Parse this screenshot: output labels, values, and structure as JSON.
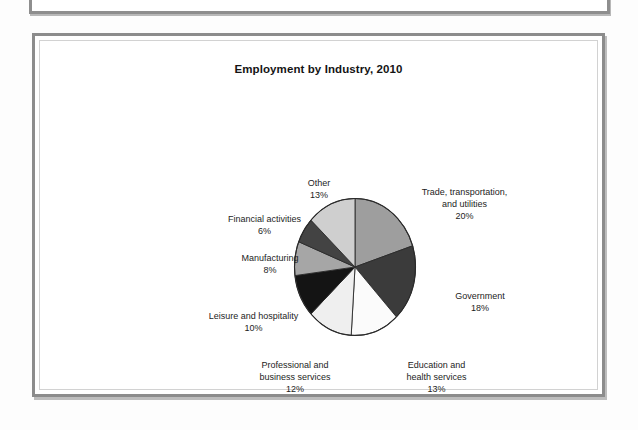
{
  "figure": {
    "title": "Employment by Industry, 2010"
  },
  "chart_data": {
    "type": "pie",
    "title": "Employment by Industry, 2010",
    "xlabel": "",
    "ylabel": "",
    "legend_position": "none",
    "labels_outside": true,
    "unit": "percent",
    "categories": [
      "Trade, transportation, and utilities",
      "Government",
      "Education and health services",
      "Professional and business services",
      "Leisure and hospitality",
      "Manufacturing",
      "Financial activities",
      "Other"
    ],
    "values": [
      20,
      18,
      13,
      12,
      10,
      8,
      6,
      13
    ],
    "colors": [
      "#9e9e9e",
      "#3b3b3b",
      "#fbfbfb",
      "#efefef",
      "#141414",
      "#a6a6a6",
      "#434343",
      "#cfcfcf"
    ],
    "slices": [
      {
        "name": "trade-transportation-utilities",
        "label_lines": [
          "Trade, transportation,",
          "and utilities",
          "20%"
        ],
        "value": 20,
        "percent_label": "20%",
        "color": "#9e9e9e"
      },
      {
        "name": "government",
        "label_lines": [
          "Government",
          "18%"
        ],
        "value": 18,
        "percent_label": "18%",
        "color": "#3b3b3b"
      },
      {
        "name": "education-health-services",
        "label_lines": [
          "Education and",
          "health services",
          "13%"
        ],
        "value": 13,
        "percent_label": "13%",
        "color": "#fbfbfb"
      },
      {
        "name": "professional-business-services",
        "label_lines": [
          "Professional and",
          "business services",
          "12%"
        ],
        "value": 12,
        "percent_label": "12%",
        "color": "#efefef"
      },
      {
        "name": "leisure-hospitality",
        "label_lines": [
          "Leisure and hospitality",
          "10%"
        ],
        "value": 10,
        "percent_label": "10%",
        "color": "#141414"
      },
      {
        "name": "manufacturing",
        "label_lines": [
          "Manufacturing",
          "8%"
        ],
        "value": 8,
        "percent_label": "8%",
        "color": "#a6a6a6"
      },
      {
        "name": "financial-activities",
        "label_lines": [
          "Financial activities",
          "6%"
        ],
        "value": 6,
        "percent_label": "6%",
        "color": "#434343"
      },
      {
        "name": "other",
        "label_lines": [
          "Other",
          "13%"
        ],
        "value": 13,
        "percent_label": "13%",
        "color": "#cfcfcf"
      }
    ]
  },
  "labels": {
    "trade_l1": "Trade, transportation,",
    "trade_l2": "and utilities",
    "trade_l3": "20%",
    "government_l1": "Government",
    "government_l2": "18%",
    "education_l1": "Education and",
    "education_l2": "health services",
    "education_l3": "13%",
    "professional_l1": "Professional and",
    "professional_l2": "business services",
    "professional_l3": "12%",
    "leisure_l1": "Leisure and hospitality",
    "leisure_l2": "10%",
    "manufacturing_l1": "Manufacturing",
    "manufacturing_l2": "8%",
    "financial_l1": "Financial activities",
    "financial_l2": "6%",
    "other_l1": "Other",
    "other_l2": "13%"
  }
}
